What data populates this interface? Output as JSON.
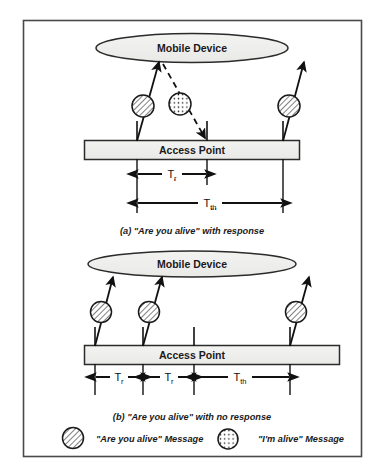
{
  "figure": {
    "border_color": "#4a4a4a",
    "background": "#ffffff",
    "ink": "#1a1a1a",
    "fill_node": "#efefee"
  },
  "panel_a": {
    "mobile_device_label": "Mobile Device",
    "access_point_label": "Access Point",
    "caption": "(a) \"Are you alive\" with response",
    "messages": [
      {
        "kind": "are-you-alive",
        "direction": "up",
        "pattern": "hatched"
      },
      {
        "kind": "im-alive",
        "direction": "down",
        "pattern": "dotted"
      },
      {
        "kind": "are-you-alive",
        "direction": "up",
        "pattern": "hatched"
      }
    ],
    "intervals": [
      {
        "label": "T",
        "sub": "r"
      },
      {
        "label": "T",
        "sub": "th"
      }
    ]
  },
  "panel_b": {
    "mobile_device_label": "Mobile Device",
    "access_point_label": "Access Point",
    "caption": "(b) \"Are you alive\" with no response",
    "messages": [
      {
        "kind": "are-you-alive",
        "direction": "up",
        "pattern": "hatched"
      },
      {
        "kind": "are-you-alive",
        "direction": "up",
        "pattern": "hatched"
      },
      {
        "kind": "are-you-alive",
        "direction": "up",
        "pattern": "hatched"
      }
    ],
    "intervals": [
      {
        "label": "T",
        "sub": "r"
      },
      {
        "label": "T",
        "sub": "r"
      },
      {
        "label": "T",
        "sub": "th"
      }
    ]
  },
  "legend": {
    "items": [
      {
        "pattern": "hatched",
        "text": "\"Are you alive\" Message"
      },
      {
        "pattern": "dotted",
        "text": "\"I'm alive\" Message"
      }
    ]
  }
}
